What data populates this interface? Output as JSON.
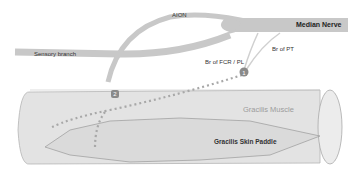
{
  "diagram": {
    "labels": {
      "aion": "AION",
      "median_nerve": "Median Nerve",
      "sensory_branch": "Sensory branch",
      "br_fcr_pl": "Br of FCR / PL",
      "br_pt": "Br of PT",
      "gracilis_muscle": "Gracilis Muscle",
      "gracilis_skin_paddle": "Gracilis Skin Paddle"
    },
    "markers": [
      {
        "id": "1",
        "label": "1"
      },
      {
        "id": "2",
        "label": "2"
      }
    ],
    "colors": {
      "nerve": "#c8c8c8",
      "muscle_fill": "#e3e3e3",
      "muscle_outline": "#b5b5b5",
      "paddle_fill": "#dcdcdc",
      "paddle_outline": "#9a9a9a",
      "dots": "#a8a8a8",
      "marker": "#8a8a8a",
      "muscle_text": "#9c9c9c",
      "text": "#333333"
    }
  }
}
